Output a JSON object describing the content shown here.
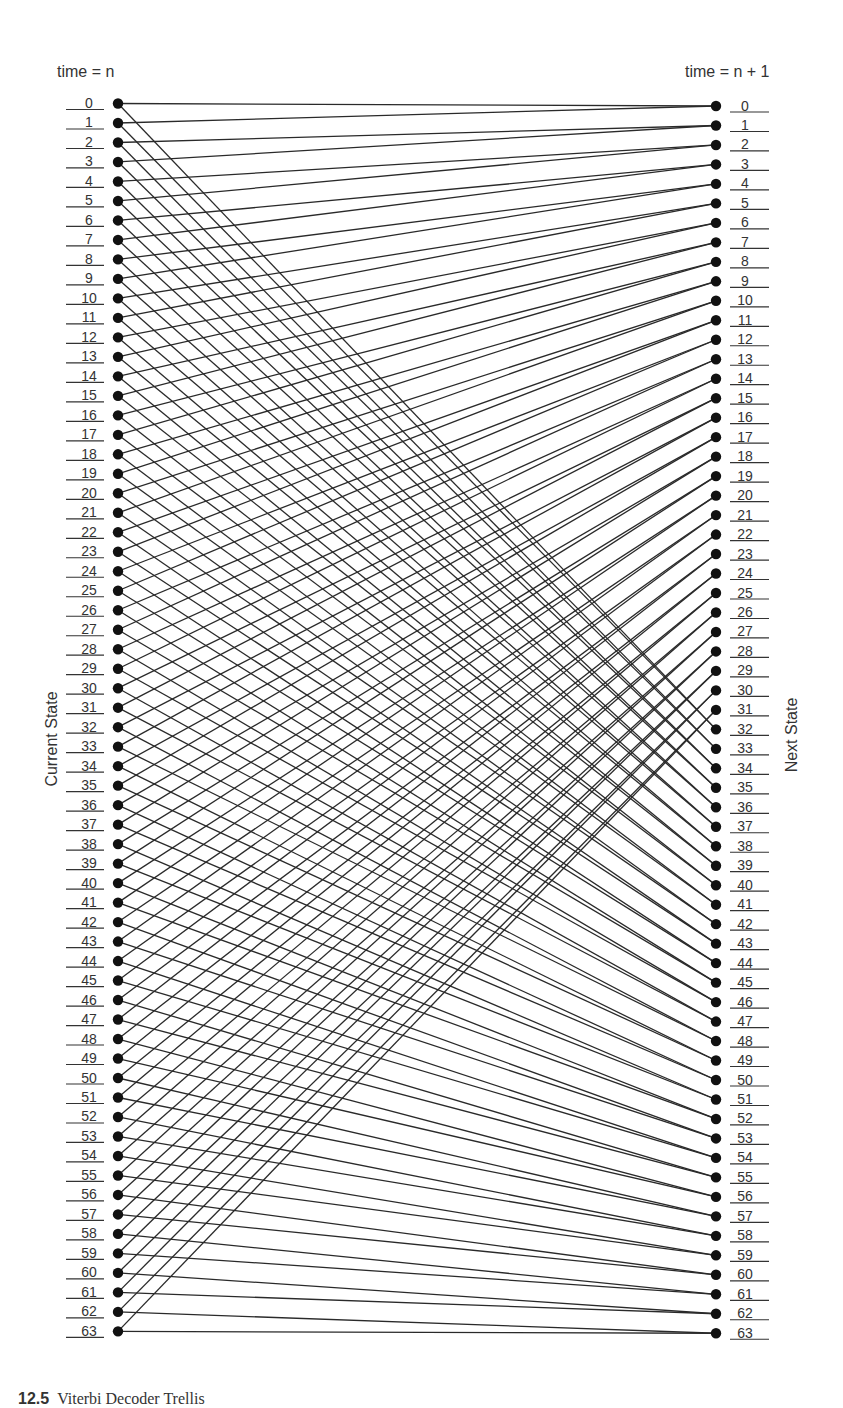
{
  "diagram": {
    "type": "trellis",
    "left_title": "time = n",
    "right_title": "time = n + 1",
    "left_axis_label": "Current State",
    "right_axis_label": "Next State",
    "caption_number": "12.5",
    "caption_text": "Viterbi Decoder Trellis",
    "num_states": 64,
    "transition_rule": "state s -> floor(s/2) and floor(s/2)+32",
    "colors": {
      "line": "#2a2a2a",
      "node": "#111111",
      "text": "#333333"
    },
    "layout": {
      "left_node_x": 118,
      "left_first_y": 103.5,
      "left_spacing": 19.49,
      "right_node_x": 716,
      "right_first_y": 106,
      "right_spacing": 19.48,
      "node_radius": 5.2,
      "left_label_x1": 66,
      "left_label_x2": 104,
      "left_label_cx": 89,
      "right_label_x1": 730,
      "right_label_x2": 769,
      "right_label_cx": 745
    },
    "left_states": [
      "0",
      "1",
      "2",
      "3",
      "4",
      "5",
      "6",
      "7",
      "8",
      "9",
      "10",
      "11",
      "12",
      "13",
      "14",
      "15",
      "16",
      "17",
      "18",
      "19",
      "20",
      "21",
      "22",
      "23",
      "24",
      "25",
      "26",
      "27",
      "28",
      "29",
      "30",
      "31",
      "32",
      "33",
      "34",
      "35",
      "36",
      "37",
      "38",
      "39",
      "40",
      "41",
      "42",
      "43",
      "44",
      "45",
      "46",
      "47",
      "48",
      "49",
      "50",
      "51",
      "52",
      "53",
      "54",
      "55",
      "56",
      "57",
      "58",
      "59",
      "60",
      "61",
      "62",
      "63"
    ],
    "right_states": [
      "0",
      "1",
      "2",
      "3",
      "4",
      "5",
      "6",
      "7",
      "8",
      "9",
      "10",
      "11",
      "12",
      "13",
      "14",
      "15",
      "16",
      "17",
      "18",
      "19",
      "20",
      "21",
      "22",
      "23",
      "24",
      "25",
      "26",
      "27",
      "28",
      "29",
      "30",
      "31",
      "32",
      "33",
      "34",
      "35",
      "36",
      "37",
      "38",
      "39",
      "40",
      "41",
      "42",
      "43",
      "44",
      "45",
      "46",
      "47",
      "48",
      "49",
      "50",
      "51",
      "52",
      "53",
      "54",
      "55",
      "56",
      "57",
      "58",
      "59",
      "60",
      "61",
      "62",
      "63"
    ],
    "edges": [
      [
        0,
        0
      ],
      [
        0,
        32
      ],
      [
        1,
        0
      ],
      [
        1,
        32
      ],
      [
        2,
        1
      ],
      [
        2,
        33
      ],
      [
        3,
        1
      ],
      [
        3,
        33
      ],
      [
        4,
        2
      ],
      [
        4,
        34
      ],
      [
        5,
        2
      ],
      [
        5,
        34
      ],
      [
        6,
        3
      ],
      [
        6,
        35
      ],
      [
        7,
        3
      ],
      [
        7,
        35
      ],
      [
        8,
        4
      ],
      [
        8,
        36
      ],
      [
        9,
        4
      ],
      [
        9,
        36
      ],
      [
        10,
        5
      ],
      [
        10,
        37
      ],
      [
        11,
        5
      ],
      [
        11,
        37
      ],
      [
        12,
        6
      ],
      [
        12,
        38
      ],
      [
        13,
        6
      ],
      [
        13,
        38
      ],
      [
        14,
        7
      ],
      [
        14,
        39
      ],
      [
        15,
        7
      ],
      [
        15,
        39
      ],
      [
        16,
        8
      ],
      [
        16,
        40
      ],
      [
        17,
        8
      ],
      [
        17,
        40
      ],
      [
        18,
        9
      ],
      [
        18,
        41
      ],
      [
        19,
        9
      ],
      [
        19,
        41
      ],
      [
        20,
        10
      ],
      [
        20,
        42
      ],
      [
        21,
        10
      ],
      [
        21,
        42
      ],
      [
        22,
        11
      ],
      [
        22,
        43
      ],
      [
        23,
        11
      ],
      [
        23,
        43
      ],
      [
        24,
        12
      ],
      [
        24,
        44
      ],
      [
        25,
        12
      ],
      [
        25,
        44
      ],
      [
        26,
        13
      ],
      [
        26,
        45
      ],
      [
        27,
        13
      ],
      [
        27,
        45
      ],
      [
        28,
        14
      ],
      [
        28,
        46
      ],
      [
        29,
        14
      ],
      [
        29,
        46
      ],
      [
        30,
        15
      ],
      [
        30,
        47
      ],
      [
        31,
        15
      ],
      [
        31,
        47
      ],
      [
        32,
        16
      ],
      [
        32,
        48
      ],
      [
        33,
        16
      ],
      [
        33,
        48
      ],
      [
        34,
        17
      ],
      [
        34,
        49
      ],
      [
        35,
        17
      ],
      [
        35,
        49
      ],
      [
        36,
        18
      ],
      [
        36,
        50
      ],
      [
        37,
        18
      ],
      [
        37,
        50
      ],
      [
        38,
        19
      ],
      [
        38,
        51
      ],
      [
        39,
        19
      ],
      [
        39,
        51
      ],
      [
        40,
        20
      ],
      [
        40,
        52
      ],
      [
        41,
        20
      ],
      [
        41,
        52
      ],
      [
        42,
        21
      ],
      [
        42,
        53
      ],
      [
        43,
        21
      ],
      [
        43,
        53
      ],
      [
        44,
        22
      ],
      [
        44,
        54
      ],
      [
        45,
        22
      ],
      [
        45,
        54
      ],
      [
        46,
        23
      ],
      [
        46,
        55
      ],
      [
        47,
        23
      ],
      [
        47,
        55
      ],
      [
        48,
        24
      ],
      [
        48,
        56
      ],
      [
        49,
        24
      ],
      [
        49,
        56
      ],
      [
        50,
        25
      ],
      [
        50,
        57
      ],
      [
        51,
        25
      ],
      [
        51,
        57
      ],
      [
        52,
        26
      ],
      [
        52,
        58
      ],
      [
        53,
        26
      ],
      [
        53,
        58
      ],
      [
        54,
        27
      ],
      [
        54,
        59
      ],
      [
        55,
        27
      ],
      [
        55,
        59
      ],
      [
        56,
        28
      ],
      [
        56,
        60
      ],
      [
        57,
        28
      ],
      [
        57,
        60
      ],
      [
        58,
        29
      ],
      [
        58,
        61
      ],
      [
        59,
        29
      ],
      [
        59,
        61
      ],
      [
        60,
        30
      ],
      [
        60,
        62
      ],
      [
        61,
        30
      ],
      [
        61,
        62
      ],
      [
        62,
        31
      ],
      [
        62,
        63
      ],
      [
        63,
        31
      ],
      [
        63,
        63
      ]
    ]
  }
}
